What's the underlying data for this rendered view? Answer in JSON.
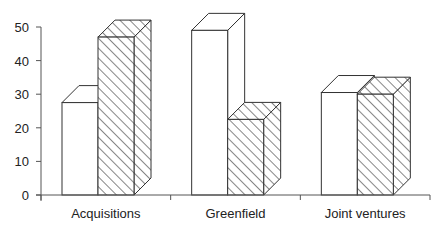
{
  "chart_data": {
    "type": "bar",
    "style": "3d-grouped",
    "title": "",
    "xlabel": "",
    "ylabel": "",
    "ylim": [
      0,
      50
    ],
    "yticks": [
      0,
      10,
      20,
      30,
      40,
      50
    ],
    "grid": false,
    "legend": null,
    "categories": [
      "Acquisitions",
      "Greenfield",
      "Joint ventures"
    ],
    "series": [
      {
        "name": "Series 1 (plain white)",
        "fill": "white",
        "values": [
          27.5,
          49,
          30.5
        ]
      },
      {
        "name": "Series 2 (hatched)",
        "fill": "diagonal-hatch",
        "values": [
          47,
          22.5,
          30
        ]
      }
    ]
  },
  "colors": {
    "stroke": "#333333",
    "plain_fill": "#ffffff",
    "hatch_line": "#222222",
    "axis": "#555555"
  }
}
